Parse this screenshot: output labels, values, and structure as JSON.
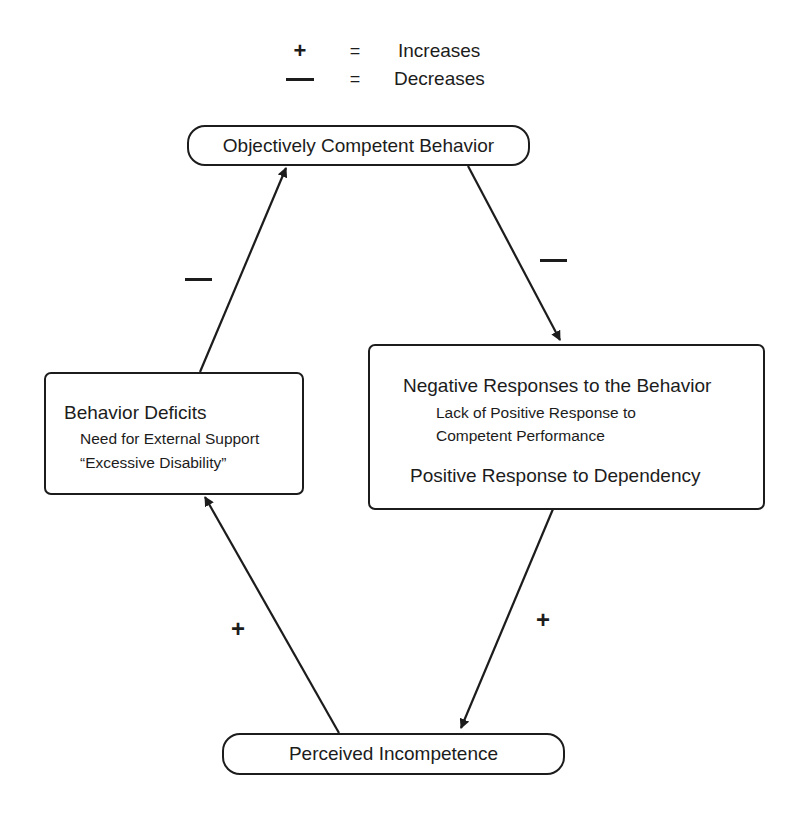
{
  "legend": [
    {
      "symbol": "+",
      "equals": "=",
      "meaning": "Increases"
    },
    {
      "symbol": "—",
      "equals": "=",
      "meaning": "Decreases"
    }
  ],
  "nodes": {
    "top": {
      "label": "Objectively Competent Behavior"
    },
    "right": {
      "title": "Negative Responses to the Behavior",
      "sub1": "Lack of Positive Response to",
      "sub2": "Competent Performance",
      "title2": "Positive Response to Dependency"
    },
    "bottom": {
      "label": "Perceived Incompetence"
    },
    "left": {
      "title": "Behavior Deficits",
      "sub1": "Need for External Support",
      "sub2": "“Excessive Disability”"
    }
  },
  "edges": [
    {
      "from": "top",
      "to": "right",
      "sign": "—",
      "meaning": "Decreases"
    },
    {
      "from": "right",
      "to": "bottom",
      "sign": "+",
      "meaning": "Increases"
    },
    {
      "from": "bottom",
      "to": "left",
      "sign": "+",
      "meaning": "Increases"
    },
    {
      "from": "left",
      "to": "top",
      "sign": "—",
      "meaning": "Decreases"
    }
  ],
  "colors": {
    "ink": "#1c1c1c",
    "background": "#ffffff"
  }
}
